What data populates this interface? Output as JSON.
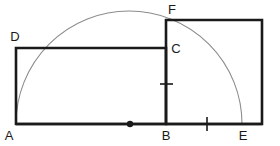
{
  "figure": {
    "background_color": "#ffffff",
    "stroke_color": "#1a1a1a",
    "arc_color": "#8c8c8c",
    "labels": {
      "a": "A",
      "b": "B",
      "c": "C",
      "d": "D",
      "e": "E",
      "f": "F"
    },
    "points": {
      "a": {
        "x": 16,
        "y": 124
      },
      "b": {
        "x": 166,
        "y": 124
      },
      "c": {
        "x": 166,
        "y": 48
      },
      "d": {
        "x": 16,
        "y": 48
      },
      "e": {
        "x": 242,
        "y": 124
      },
      "f": {
        "x": 166,
        "y": 20
      },
      "center": {
        "x": 130,
        "y": 124
      }
    },
    "square_corners": {
      "top_left": {
        "x": 166,
        "y": 20
      },
      "top_right": {
        "x": 262,
        "y": 20
      },
      "bottom_right": {
        "x": 262,
        "y": 124
      },
      "bottom_left": {
        "x": 166,
        "y": 124
      }
    },
    "arc": {
      "center_x": 130,
      "center_y": 124,
      "radius": 113,
      "start_x": 16,
      "start_y": 124,
      "end_x": 242,
      "end_y": 124
    },
    "tick_marks": [
      {
        "name": "tick-on-bc",
        "x": 166,
        "y": 84,
        "orientation": "horizontal"
      },
      {
        "name": "tick-on-be",
        "x": 207,
        "y": 124,
        "orientation": "vertical"
      }
    ],
    "center_dot": {
      "x": 130,
      "y": 124,
      "radius": 3.2
    }
  }
}
